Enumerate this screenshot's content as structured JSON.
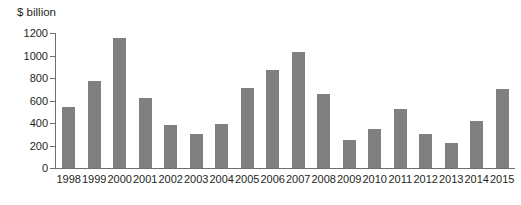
{
  "chart_data": {
    "type": "bar",
    "title": "",
    "subtitle": "",
    "xlabel": "",
    "ylabel": "$ billion",
    "unit_label": "$ billion",
    "categories": [
      "1998",
      "1999",
      "2000",
      "2001",
      "2002",
      "2003",
      "2004",
      "2005",
      "2006",
      "2007",
      "2008",
      "2009",
      "2010",
      "2011",
      "2012",
      "2013",
      "2014",
      "2015"
    ],
    "values": [
      540,
      770,
      1160,
      625,
      380,
      300,
      390,
      715,
      875,
      1030,
      655,
      250,
      345,
      525,
      305,
      225,
      420,
      700
    ],
    "ylim": [
      0,
      1200
    ],
    "ytick_values": [
      0,
      200,
      400,
      600,
      800,
      1000,
      1200
    ],
    "ytick_labels": [
      "0",
      "200",
      "400",
      "600",
      "800",
      "1000",
      "1200"
    ],
    "grid": false,
    "legend": null,
    "legend_position": "none",
    "bar_color": "#808080",
    "axis_color": "#6f6f6f",
    "text_color": "#231f20",
    "background_color": "#ffffff",
    "annotations": []
  }
}
